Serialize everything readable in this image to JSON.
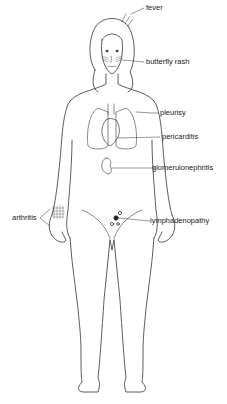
{
  "diagram": {
    "labels": [
      {
        "id": "fever",
        "text": "fever"
      },
      {
        "id": "butterfly-rash",
        "text": "butterfly rash"
      },
      {
        "id": "pleurisy",
        "text": "pleurisy"
      },
      {
        "id": "pericarditis",
        "text": "pericarditis"
      },
      {
        "id": "glomerulonephritis",
        "text": "glomerulonephritis"
      },
      {
        "id": "lymphadenopathy",
        "text": "lymphadenopathy"
      },
      {
        "id": "arthritis",
        "text": "arthritis"
      }
    ],
    "colors": {
      "line": "#333333",
      "text": "#222222",
      "background": "#ffffff"
    }
  }
}
